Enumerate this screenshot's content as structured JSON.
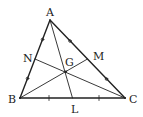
{
  "diagram": {
    "colors": {
      "stroke": "#222222",
      "background": "#ffffff"
    },
    "points": {
      "A": {
        "label": "A",
        "x": 50,
        "y": 20
      },
      "B": {
        "label": "B",
        "x": 20,
        "y": 98
      },
      "C": {
        "label": "C",
        "x": 125,
        "y": 98
      },
      "N": {
        "label": "N",
        "x": 35,
        "y": 59
      },
      "M": {
        "label": "M",
        "x": 87.5,
        "y": 59
      },
      "L": {
        "label": "L",
        "x": 72.5,
        "y": 98
      },
      "G": {
        "label": "G",
        "x": 65.8,
        "y": 71.7
      }
    },
    "segments": [
      {
        "from": "A",
        "to": "B",
        "role": "side"
      },
      {
        "from": "B",
        "to": "C",
        "role": "side"
      },
      {
        "from": "C",
        "to": "A",
        "role": "side"
      },
      {
        "from": "A",
        "to": "L",
        "role": "median"
      },
      {
        "from": "B",
        "to": "M",
        "role": "median"
      },
      {
        "from": "C",
        "to": "N",
        "role": "median"
      }
    ],
    "equal_marks": [
      {
        "segment": "AN",
        "mark": "circle"
      },
      {
        "segment": "NB",
        "mark": "circle"
      },
      {
        "segment": "AM",
        "mark": "circle"
      },
      {
        "segment": "MC",
        "mark": "circle"
      },
      {
        "segment": "BL",
        "mark": "tick"
      },
      {
        "segment": "LC",
        "mark": "tick"
      }
    ]
  }
}
